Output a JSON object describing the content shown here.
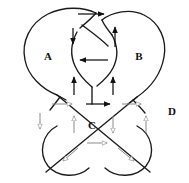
{
  "diagram": {
    "kind": "knot-diagram",
    "canvas": {
      "width": 189,
      "height": 183,
      "background": "#ffffff"
    },
    "stroke_color": "#1a1a1a",
    "region_labels": [
      {
        "id": "A",
        "text": "A",
        "x": 48,
        "y": 57
      },
      {
        "id": "B",
        "text": "B",
        "x": 139,
        "y": 57
      },
      {
        "id": "C",
        "text": "C",
        "x": 92,
        "y": 126
      },
      {
        "id": "D",
        "text": "D",
        "x": 172,
        "y": 112
      }
    ],
    "arrow_styles": {
      "solid": {
        "color": "#111111",
        "fill": "#111111",
        "description": "filled black arrow"
      },
      "hollow": {
        "color": "#8a8a8a",
        "fill": "#ffffff",
        "description": "outlined gray arrow"
      }
    },
    "arrows": [
      {
        "id": "top-horizontal",
        "style": "solid",
        "direction": "right",
        "x1": 78,
        "y1": 14,
        "x2": 104,
        "y2": 14
      },
      {
        "id": "upper-left-down",
        "style": "solid",
        "direction": "down",
        "x1": 73,
        "y1": 28,
        "x2": 73,
        "y2": 44
      },
      {
        "id": "upper-right-up",
        "style": "solid",
        "direction": "up",
        "x1": 115,
        "y1": 47,
        "x2": 115,
        "y2": 27
      },
      {
        "id": "center-left",
        "style": "solid",
        "direction": "left",
        "x1": 108,
        "y1": 60,
        "x2": 80,
        "y2": 60
      },
      {
        "id": "lower-left-up",
        "style": "solid",
        "direction": "up",
        "x1": 74,
        "y1": 95,
        "x2": 74,
        "y2": 77
      },
      {
        "id": "lower-right-up",
        "style": "solid",
        "direction": "up",
        "x1": 113,
        "y1": 95,
        "x2": 113,
        "y2": 77
      },
      {
        "id": "midleft-right-hollow",
        "style": "hollow",
        "direction": "right",
        "x1": 52,
        "y1": 104,
        "x2": 72,
        "y2": 104
      },
      {
        "id": "mid-center-right-solid",
        "style": "solid",
        "direction": "right",
        "x1": 86,
        "y1": 104,
        "x2": 110,
        "y2": 104
      },
      {
        "id": "mid-right-hollow",
        "style": "hollow",
        "direction": "right",
        "x1": 122,
        "y1": 104,
        "x2": 141,
        "y2": 104
      },
      {
        "id": "left-down-hollow",
        "style": "hollow",
        "direction": "down",
        "x1": 40,
        "y1": 113,
        "x2": 40,
        "y2": 129
      },
      {
        "id": "c-left-up-hollow",
        "style": "hollow",
        "direction": "up",
        "x1": 74,
        "y1": 133,
        "x2": 74,
        "y2": 116
      },
      {
        "id": "c-right-down-hollow",
        "style": "hollow",
        "direction": "down",
        "x1": 113,
        "y1": 116,
        "x2": 113,
        "y2": 133
      },
      {
        "id": "far-right-up-hollow",
        "style": "hollow",
        "direction": "up",
        "x1": 146,
        "y1": 133,
        "x2": 146,
        "y2": 116
      },
      {
        "id": "c-bottom-right-hollow",
        "style": "hollow",
        "direction": "right",
        "x1": 87,
        "y1": 143,
        "x2": 107,
        "y2": 143
      },
      {
        "id": "bottom-left-diag-hollow",
        "style": "hollow",
        "direction": "down-left",
        "x1": 78,
        "y1": 148,
        "x2": 63,
        "y2": 161
      },
      {
        "id": "bottom-right-diag-hollow",
        "style": "hollow",
        "direction": "down-right",
        "x1": 118,
        "y1": 148,
        "x2": 134,
        "y2": 161
      }
    ],
    "strands": [
      {
        "id": "left-lobe-outer",
        "description": "large left heart lobe from top crossing sweeping left and down"
      },
      {
        "id": "right-lobe-outer",
        "description": "large right heart lobe from top crossing sweeping right and down"
      },
      {
        "id": "center-lens-left",
        "description": "left side of central lens shape"
      },
      {
        "id": "center-lens-right",
        "description": "right side of central lens shape"
      },
      {
        "id": "lower-diag-nw-se",
        "description": "lower diagonal strand running northwest to southeast"
      },
      {
        "id": "lower-diag-ne-sw",
        "description": "lower diagonal strand running northeast to southwest"
      },
      {
        "id": "bottom-left-loop",
        "description": "bottom left circular loop"
      },
      {
        "id": "bottom-right-loop",
        "description": "bottom right circular loop"
      }
    ]
  }
}
